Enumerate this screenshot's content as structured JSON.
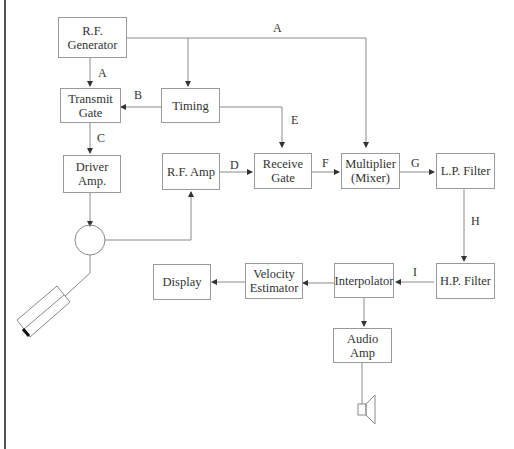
{
  "blocks": {
    "rf_generator": "R.F. Generator",
    "transmit_gate": "Transmit Gate",
    "timing": "Timing",
    "driver_amp": "Driver Amp.",
    "rf_amp": "R.F. Amp",
    "receive_gate": "Receive Gate",
    "multiplier": "Multiplier (Mixer)",
    "lp_filter": "L.P. Filter",
    "hp_filter": "H.P. Filter",
    "interpolator": "Interpolator",
    "velocity_estimator": "Velocity Estimator",
    "display": "Display",
    "audio_amp": "Audio Amp"
  },
  "signals": {
    "a_top": "A",
    "a_left": "A",
    "b": "B",
    "c": "C",
    "d": "D",
    "e": "E",
    "f": "F",
    "g": "G",
    "h": "H",
    "i": "I"
  },
  "colors": {
    "line": "#8a8a8a",
    "border": "#9a9a9a",
    "text": "#333333"
  }
}
